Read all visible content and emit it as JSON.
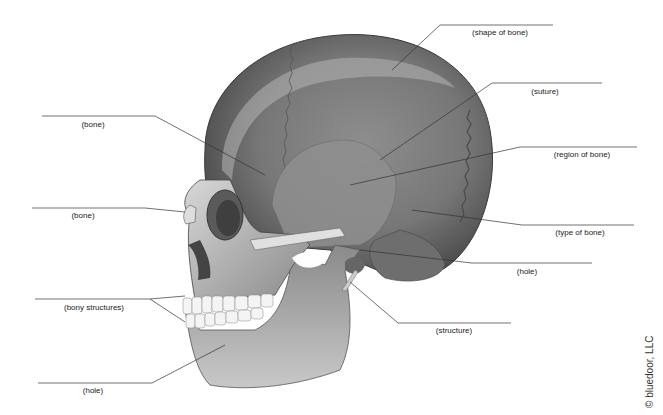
{
  "diagram": {
    "labels": [
      {
        "id": "shape_of_bone",
        "text": "(shape of bone)",
        "x": 500,
        "y": 28
      },
      {
        "id": "suture",
        "text": "(suture)",
        "x": 545,
        "y": 87
      },
      {
        "id": "bone_upper",
        "text": "(bone)",
        "x": 93,
        "y": 120
      },
      {
        "id": "region_of_bone",
        "text": "(region of bone)",
        "x": 582,
        "y": 150
      },
      {
        "id": "bone_nasal",
        "text": "(bone)",
        "x": 83,
        "y": 211
      },
      {
        "id": "type_of_bone",
        "text": "(type of bone)",
        "x": 580,
        "y": 227
      },
      {
        "id": "hole_ear",
        "text": "(hole)",
        "x": 527,
        "y": 266
      },
      {
        "id": "bony_structures",
        "text": "(bony structures)",
        "x": 94,
        "y": 303
      },
      {
        "id": "structure",
        "text": "(structure)",
        "x": 454,
        "y": 326
      },
      {
        "id": "hole_jaw",
        "text": "(hole)",
        "x": 93,
        "y": 386
      }
    ],
    "copyright": "© bluedoor, LLC"
  }
}
